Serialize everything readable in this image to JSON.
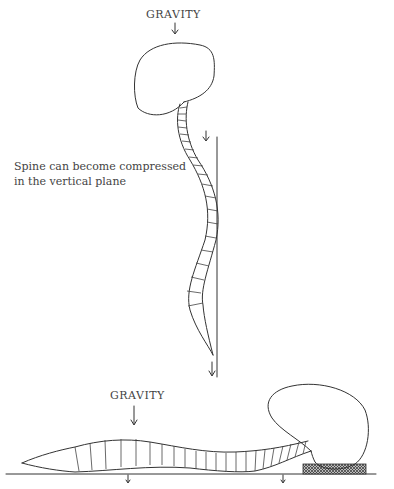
{
  "figure": {
    "top": {
      "force_label": "GRAVITY",
      "caption_lines": [
        "Spine can become compressed",
        "in the vertical plane"
      ]
    },
    "bottom": {
      "force_label": "GRAVITY"
    }
  },
  "icons": {
    "gravity_arrow": "down-arrow",
    "support_pad": "crosshatch-pad"
  }
}
